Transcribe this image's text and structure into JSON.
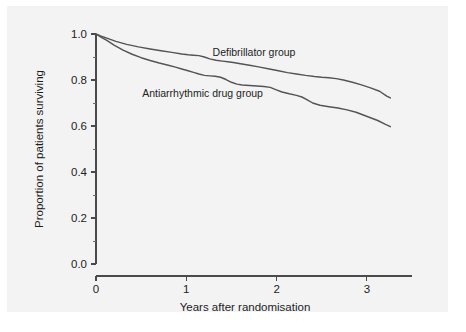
{
  "figure": {
    "background_color": "#f3f3f3",
    "page_color": "#ffffff",
    "line_color": "#545454",
    "axis_color": "#4a4a4a",
    "text_color": "#1d1d1d"
  },
  "chart_data": {
    "type": "line",
    "title": "",
    "subtitle": "",
    "xlabel": "Years after randomisation",
    "ylabel": "Proportion of patients surviving",
    "xlim": [
      0,
      3.5
    ],
    "ylim": [
      0,
      1
    ],
    "xticks": [
      0,
      1,
      2,
      3
    ],
    "xtick_labels": [
      "0",
      "1",
      "2",
      "3"
    ],
    "yticks": [
      0.0,
      0.2,
      0.4,
      0.6,
      0.8,
      1.0
    ],
    "ytick_labels": [
      "0.0",
      "0.2",
      "0.4",
      "0.6",
      "0.8",
      "1.0"
    ],
    "yticks_minor": [
      0.1,
      0.3,
      0.5,
      0.7,
      0.9
    ],
    "grid": false,
    "legend_position": "inline-annotation",
    "annotations": [
      {
        "text": "Defibrillator group",
        "x": 1.75,
        "y": 0.905
      },
      {
        "text": "Antiarrhythmic drug group",
        "x": 1.18,
        "y": 0.7275
      }
    ],
    "series": [
      {
        "name": "Defibrillator group",
        "x": [
          0.0,
          0.05,
          0.12,
          0.22,
          0.34,
          0.47,
          0.6,
          0.72,
          0.84,
          0.95,
          1.02,
          1.08,
          1.14,
          1.2,
          1.26,
          1.33,
          1.4,
          1.46,
          1.52,
          1.6,
          1.7,
          1.8,
          1.92,
          2.02,
          2.12,
          2.22,
          2.32,
          2.42,
          2.5,
          2.58,
          2.66,
          2.74,
          2.84,
          2.94,
          3.04,
          3.14,
          3.22,
          3.26
        ],
        "y": [
          1.0,
          0.992,
          0.982,
          0.968,
          0.955,
          0.944,
          0.935,
          0.927,
          0.92,
          0.913,
          0.91,
          0.908,
          0.906,
          0.9,
          0.892,
          0.886,
          0.882,
          0.879,
          0.876,
          0.871,
          0.864,
          0.857,
          0.848,
          0.84,
          0.832,
          0.826,
          0.82,
          0.815,
          0.812,
          0.81,
          0.806,
          0.8,
          0.79,
          0.779,
          0.766,
          0.751,
          0.73,
          0.722
        ]
      },
      {
        "name": "Antiarrhythmic drug group",
        "x": [
          0.0,
          0.05,
          0.12,
          0.2,
          0.3,
          0.4,
          0.5,
          0.6,
          0.7,
          0.8,
          0.88,
          0.95,
          1.02,
          1.08,
          1.14,
          1.2,
          1.26,
          1.32,
          1.38,
          1.44,
          1.5,
          1.56,
          1.62,
          1.7,
          1.78,
          1.86,
          1.93,
          1.99,
          2.06,
          2.14,
          2.22,
          2.28,
          2.34,
          2.4,
          2.48,
          2.58,
          2.68,
          2.78,
          2.88,
          2.96,
          3.04,
          3.12,
          3.2,
          3.26
        ],
        "y": [
          1.0,
          0.988,
          0.972,
          0.952,
          0.93,
          0.912,
          0.897,
          0.885,
          0.874,
          0.864,
          0.856,
          0.848,
          0.84,
          0.833,
          0.826,
          0.82,
          0.818,
          0.816,
          0.812,
          0.802,
          0.79,
          0.782,
          0.778,
          0.776,
          0.774,
          0.772,
          0.768,
          0.758,
          0.748,
          0.74,
          0.733,
          0.726,
          0.714,
          0.7,
          0.69,
          0.684,
          0.678,
          0.67,
          0.66,
          0.648,
          0.636,
          0.624,
          0.608,
          0.597
        ]
      }
    ]
  }
}
